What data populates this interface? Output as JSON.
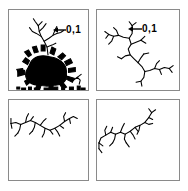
{
  "figure": {
    "background_color": "#ffffff",
    "ink_color": "#000000",
    "border_color": "#8a8a8a",
    "panels": [
      {
        "id": "panel-1",
        "position": "top-left",
        "content_description": "dense dark branching cluster with filled body and thin upper dendrite",
        "annotation": "0,1",
        "annotation_arrow": "left-arrow",
        "has_annotation": true
      },
      {
        "id": "panel-2",
        "position": "top-right",
        "content_description": "sparse thin branching dendritic curve",
        "annotation": "0,1",
        "annotation_arrow": "left-arrow",
        "has_annotation": true
      },
      {
        "id": "panel-3",
        "position": "bottom-left",
        "content_description": "thin horizontal dendritic branch across upper area",
        "annotation": "",
        "annotation_arrow": "",
        "has_annotation": false
      },
      {
        "id": "panel-4",
        "position": "bottom-right",
        "content_description": "thin dendritic branch rising to the right",
        "annotation": "",
        "annotation_arrow": "",
        "has_annotation": false
      }
    ]
  }
}
